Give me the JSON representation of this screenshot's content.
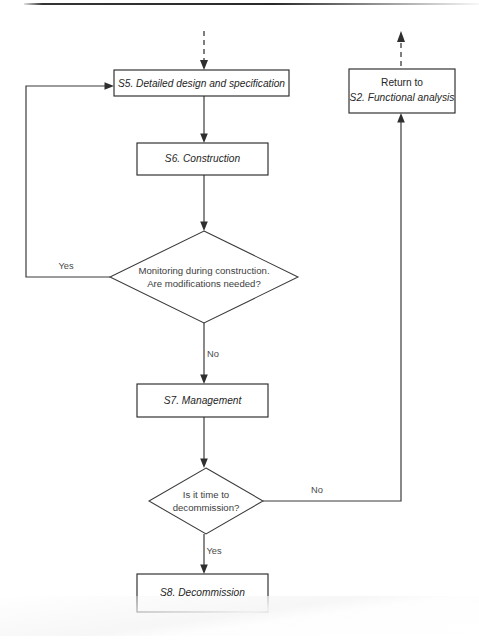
{
  "diagram": {
    "stroke_color": "#3b3b3b",
    "box_fill": "#ffffff",
    "text_color": "#262626"
  },
  "nodes": {
    "s5": {
      "id": "s5",
      "shape": "process",
      "label": "S5. Detailed design and specification",
      "style": "italic",
      "x": 114,
      "y": 70,
      "w": 175,
      "h": 26
    },
    "s6": {
      "id": "s6",
      "shape": "process",
      "label": "S6. Construction",
      "style": "italic",
      "x": 137,
      "y": 143,
      "w": 131,
      "h": 32
    },
    "monitoring": {
      "id": "monitoring",
      "shape": "decision",
      "label_line1": "Monitoring during construction.",
      "label_line2": "Are modifications needed?",
      "cx": 204,
      "cy": 277,
      "rx": 94,
      "ry": 46
    },
    "s7": {
      "id": "s7",
      "shape": "process",
      "label": "S7. Management",
      "style": "italic",
      "x": 137,
      "y": 384,
      "w": 131,
      "h": 33
    },
    "decommission_q": {
      "id": "decommission-question",
      "shape": "decision",
      "label_line1": "Is it time to",
      "label_line2": "decommission?",
      "cx": 206,
      "cy": 501,
      "rx": 57,
      "ry": 33
    },
    "s8": {
      "id": "s8",
      "shape": "process",
      "label": "S8. Decommission",
      "style": "italic",
      "x": 137,
      "y": 574,
      "w": 131,
      "h": 38
    },
    "return_s2": {
      "id": "return-to-s2",
      "shape": "process",
      "label_line1": "Return to",
      "label_line1_style": "roman",
      "label_line2": "S2. Functional analysis",
      "label_line2_style": "italic",
      "x": 349,
      "y": 69,
      "w": 106,
      "h": 44
    }
  },
  "edge_labels": {
    "yes_monitoring": "Yes",
    "no_monitoring": "No",
    "no_decommission": "No",
    "yes_decommission": "Yes"
  },
  "edges": [
    {
      "name": "entry-dashed-into-s5",
      "from": "external-top",
      "to": "s5",
      "style": "dashed",
      "arrow": true
    },
    {
      "name": "s5-to-s6",
      "from": "s5",
      "to": "s6",
      "style": "solid",
      "arrow": true
    },
    {
      "name": "s6-to-monitoring",
      "from": "s6",
      "to": "monitoring",
      "style": "solid",
      "arrow": true
    },
    {
      "name": "monitoring-yes-to-s5",
      "from": "monitoring",
      "to": "s5",
      "style": "solid",
      "arrow": true,
      "label": "Yes"
    },
    {
      "name": "monitoring-no-to-s7",
      "from": "monitoring",
      "to": "s7",
      "style": "solid",
      "arrow": true,
      "label": "No"
    },
    {
      "name": "s7-to-decommission-question",
      "from": "s7",
      "to": "decommission_q",
      "style": "solid",
      "arrow": true
    },
    {
      "name": "decommission-no-to-return-s2",
      "from": "decommission_q",
      "to": "return_s2",
      "style": "solid",
      "arrow": true,
      "label": "No"
    },
    {
      "name": "decommission-yes-to-s8",
      "from": "decommission_q",
      "to": "s8",
      "style": "solid",
      "arrow": true,
      "label": "Yes"
    },
    {
      "name": "return-s2-dashed-exit",
      "from": "return_s2",
      "to": "external-top",
      "style": "dashed",
      "arrow": true
    }
  ]
}
